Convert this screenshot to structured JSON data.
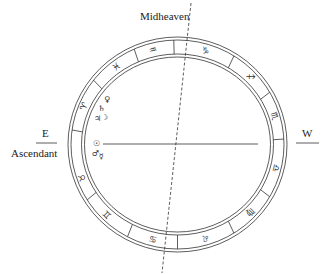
{
  "labels": {
    "midheaven": "Midheaven",
    "east": "E",
    "ascendant": "Ascendant",
    "west": "W"
  },
  "signs": [
    {
      "name": "aries",
      "glyph": "♈",
      "angle": 157
    },
    {
      "name": "pisces",
      "glyph": "♓",
      "angle": 127
    },
    {
      "name": "aquarius",
      "glyph": "♒",
      "angle": 104
    },
    {
      "name": "capricorn",
      "glyph": "♑",
      "angle": 74
    },
    {
      "name": "sagittarius",
      "glyph": "♐",
      "angle": 44
    },
    {
      "name": "scorpio",
      "glyph": "♏",
      "angle": 17
    },
    {
      "name": "libra",
      "glyph": "♎",
      "angle": -14
    },
    {
      "name": "virgo",
      "glyph": "♍",
      "angle": -44
    },
    {
      "name": "leo",
      "glyph": "♌",
      "angle": -74
    },
    {
      "name": "cancer",
      "glyph": "♋",
      "angle": -104
    },
    {
      "name": "gemini",
      "glyph": "♊",
      "angle": -134
    },
    {
      "name": "taurus",
      "glyph": "♉",
      "angle": -160
    }
  ],
  "planets": [
    {
      "name": "venus",
      "glyph": "♀",
      "x": 104,
      "y": 102
    },
    {
      "name": "saturn",
      "glyph": "♄",
      "x": 98,
      "y": 111
    },
    {
      "name": "jupiter",
      "glyph": "♃",
      "x": 94,
      "y": 121
    },
    {
      "name": "moon",
      "glyph": "☽",
      "x": 101,
      "y": 120
    },
    {
      "name": "sun",
      "glyph": "☉",
      "x": 93,
      "y": 146
    },
    {
      "name": "mars",
      "glyph": "♂",
      "x": 92,
      "y": 156
    },
    {
      "name": "mercury",
      "glyph": "☿",
      "x": 99,
      "y": 159
    }
  ],
  "dividers": [
    172,
    142,
    114,
    92,
    58,
    30,
    3,
    -30,
    -58,
    -90,
    -118,
    -148
  ],
  "colors": {
    "line": "#333333",
    "text": "#222222"
  }
}
